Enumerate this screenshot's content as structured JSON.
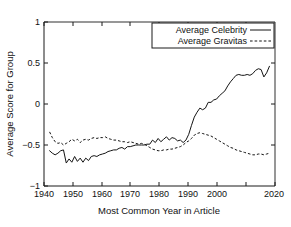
{
  "chart_data": {
    "type": "line",
    "title": "",
    "xlabel": "Most Common Year in Article",
    "ylabel": "Average Score for Group",
    "xlim": [
      1938,
      2021
    ],
    "ylim": [
      -1,
      1
    ],
    "xticks": [
      1940,
      1950,
      1960,
      1970,
      1980,
      1990,
      2000,
      2010,
      2020
    ],
    "xtick_labels": [
      "1940",
      "1950",
      "1960",
      "1970",
      "1980",
      "1990",
      "2000",
      "2010",
      "2020"
    ],
    "xtick_labels_shown": [
      "1940",
      "1950",
      "1960",
      "1970",
      "1980",
      "1990",
      "2000",
      "2020"
    ],
    "yticks": [
      -1,
      -0.5,
      0,
      0.5,
      1
    ],
    "ytick_labels": [
      "−1",
      "−0.5",
      "0",
      "0.5",
      "1"
    ],
    "grid": false,
    "legend_position": "top-right",
    "x": [
      1940,
      1941,
      1942,
      1943,
      1944,
      1945,
      1946,
      1947,
      1948,
      1949,
      1950,
      1951,
      1952,
      1953,
      1954,
      1955,
      1956,
      1957,
      1958,
      1959,
      1960,
      1961,
      1962,
      1963,
      1964,
      1965,
      1966,
      1967,
      1968,
      1969,
      1970,
      1971,
      1972,
      1973,
      1974,
      1975,
      1976,
      1977,
      1978,
      1979,
      1980,
      1981,
      1982,
      1983,
      1984,
      1985,
      1986,
      1987,
      1988,
      1989,
      1990,
      1991,
      1992,
      1993,
      1994,
      1995,
      1996,
      1997,
      1998,
      1999,
      2000,
      2001,
      2002,
      2003,
      2004,
      2005,
      2006,
      2007,
      2008,
      2009,
      2010,
      2011,
      2012,
      2013,
      2014,
      2015,
      2016,
      2017,
      2018,
      2019
    ],
    "series": [
      {
        "name": "Average Celebrity",
        "style": "solid",
        "color": "#141414",
        "values": [
          -0.57,
          -0.6,
          -0.62,
          -0.6,
          -0.57,
          -0.56,
          -0.72,
          -0.67,
          -0.71,
          -0.64,
          -0.7,
          -0.66,
          -0.71,
          -0.66,
          -0.69,
          -0.64,
          -0.63,
          -0.64,
          -0.62,
          -0.61,
          -0.6,
          -0.58,
          -0.57,
          -0.56,
          -0.56,
          -0.54,
          -0.53,
          -0.55,
          -0.52,
          -0.52,
          -0.51,
          -0.5,
          -0.5,
          -0.5,
          -0.5,
          -0.49,
          -0.49,
          -0.44,
          -0.47,
          -0.42,
          -0.46,
          -0.43,
          -0.4,
          -0.44,
          -0.41,
          -0.42,
          -0.45,
          -0.44,
          -0.47,
          -0.44,
          -0.37,
          -0.26,
          -0.16,
          -0.1,
          -0.05,
          -0.07,
          -0.05,
          0.02,
          0.02,
          0.05,
          0.06,
          0.1,
          0.13,
          0.16,
          0.22,
          0.27,
          0.31,
          0.35,
          0.36,
          0.35,
          0.35,
          0.36,
          0.35,
          0.37,
          0.41,
          0.43,
          0.42,
          0.33,
          0.38,
          0.46
        ]
      },
      {
        "name": "Average Gravitas",
        "style": "dashed",
        "color": "#141414",
        "values": [
          -0.34,
          -0.41,
          -0.46,
          -0.48,
          -0.47,
          -0.5,
          -0.48,
          -0.46,
          -0.43,
          -0.45,
          -0.43,
          -0.47,
          -0.44,
          -0.43,
          -0.44,
          -0.42,
          -0.41,
          -0.42,
          -0.41,
          -0.41,
          -0.4,
          -0.42,
          -0.43,
          -0.44,
          -0.44,
          -0.45,
          -0.46,
          -0.46,
          -0.47,
          -0.46,
          -0.47,
          -0.48,
          -0.49,
          -0.48,
          -0.49,
          -0.51,
          -0.53,
          -0.55,
          -0.56,
          -0.57,
          -0.57,
          -0.56,
          -0.56,
          -0.55,
          -0.55,
          -0.54,
          -0.53,
          -0.52,
          -0.5,
          -0.47,
          -0.45,
          -0.42,
          -0.38,
          -0.36,
          -0.35,
          -0.36,
          -0.37,
          -0.38,
          -0.39,
          -0.41,
          -0.43,
          -0.45,
          -0.47,
          -0.49,
          -0.51,
          -0.53,
          -0.54,
          -0.56,
          -0.57,
          -0.58,
          -0.59,
          -0.6,
          -0.61,
          -0.62,
          -0.62,
          -0.61,
          -0.61,
          -0.62,
          -0.61,
          -0.6
        ]
      }
    ]
  },
  "legend": {
    "entries": [
      {
        "label": "Average Celebrity"
      },
      {
        "label": "Average Gravitas"
      }
    ]
  },
  "axes": {
    "x_title": "Most Common Year in Article",
    "y_title": "Average Score for Group"
  },
  "ticks": {
    "x": [
      "1940",
      "1950",
      "1960",
      "1970",
      "1980",
      "1990",
      "2000",
      "2020"
    ],
    "y": [
      "1",
      "0.5",
      "0",
      "−0.5",
      "−1"
    ]
  }
}
